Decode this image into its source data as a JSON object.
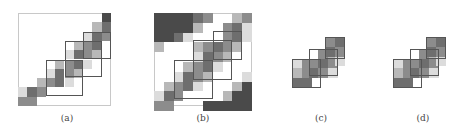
{
  "figure": {
    "panels": [
      {
        "id": "a",
        "label": "(a)"
      },
      {
        "id": "b",
        "label": "(b)"
      },
      {
        "id": "c",
        "label": "(c)"
      },
      {
        "id": "d",
        "label": "(d)"
      }
    ]
  },
  "colors": {
    "dark": "#4a4a4a",
    "mid_dark": "#6e6e6e",
    "mid": "#8c8c8c",
    "light": "#b8b8b8",
    "very_light": "#dcdcdc",
    "frame": "#c8c8c8",
    "box": "#555555"
  }
}
